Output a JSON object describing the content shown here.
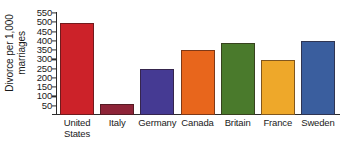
{
  "chart_data": {
    "type": "bar",
    "title": "",
    "xlabel": "",
    "ylabel": "Divorce per 1,000\nmarriages",
    "categories": [
      "United\nStates",
      "Italy",
      "Germany",
      "Canada",
      "Britain",
      "France",
      "Sweden"
    ],
    "category_names": [
      "United States",
      "Italy",
      "Germany",
      "Canada",
      "Britain",
      "France",
      "Sweden"
    ],
    "values": [
      495,
      60,
      248,
      352,
      390,
      295,
      398
    ],
    "colors": [
      "#cc2229",
      "#8e2438",
      "#453a93",
      "#e8661c",
      "#4a7a2c",
      "#eea82a",
      "#3a5e9e"
    ],
    "ylim": [
      0,
      550
    ],
    "baseline": 0,
    "y_ticks": [
      550,
      500,
      450,
      400,
      350,
      300,
      250,
      200,
      150,
      100,
      50
    ],
    "y_tick_labels": [
      "550",
      "500",
      "450",
      "400",
      "350",
      "300",
      "250",
      "200",
      "150",
      "100",
      "50"
    ],
    "grid": false,
    "legend": "none"
  }
}
